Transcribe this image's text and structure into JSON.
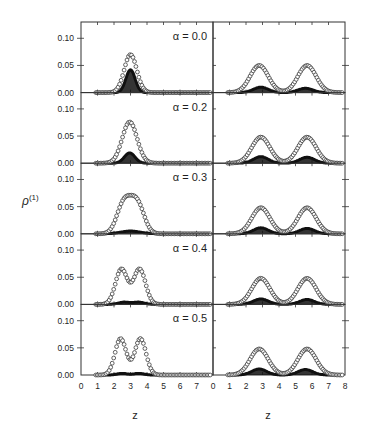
{
  "chart_data": {
    "type": "line",
    "title": "",
    "layout": {
      "rows": 5,
      "columns": 2,
      "shared_y_label": "ρ(1)",
      "xlabel": "z",
      "grid": false,
      "legend": "none; open circles and filled symbols as two series per panel"
    },
    "ylabel": "ρ(1)",
    "ylabel_main": "ρ",
    "ylabel_sup": "(1)",
    "xlabel": "z",
    "left_column": {
      "xlim": [
        0,
        8
      ],
      "x_tick_labels": [
        "0",
        "1",
        "2",
        "3",
        "4",
        "5",
        "6",
        "7"
      ],
      "ylim": [
        0,
        0.13
      ],
      "y_tick_labels": [
        "0.00",
        "0.05",
        "0.10"
      ],
      "y_ticks": [
        0,
        0.05,
        0.1
      ]
    },
    "right_column": {
      "xlim": [
        0,
        8
      ],
      "x_tick_labels": [
        "0",
        "1",
        "2",
        "3",
        "4",
        "5",
        "6",
        "7",
        "8"
      ],
      "ylim": [
        0,
        0.13
      ]
    },
    "series_names": [
      "open circles (total density)",
      "filled symbols"
    ],
    "panels": [
      {
        "label": "α = 0.0",
        "left": {
          "open": [
            {
              "mu": 3.0,
              "sigma": 0.38,
              "amp": 0.07
            }
          ],
          "filled": [
            {
              "mu": 3.0,
              "sigma": 0.28,
              "amp": 0.042
            }
          ]
        },
        "right": {
          "open": [
            {
              "mu": 2.8,
              "sigma": 0.55,
              "amp": 0.05
            },
            {
              "mu": 5.7,
              "sigma": 0.55,
              "amp": 0.05
            }
          ],
          "filled": [
            {
              "mu": 2.9,
              "sigma": 0.45,
              "amp": 0.01
            },
            {
              "mu": 5.6,
              "sigma": 0.45,
              "amp": 0.008
            }
          ]
        }
      },
      {
        "label": "α = 0.2",
        "left": {
          "open": [
            {
              "mu": 2.95,
              "sigma": 0.45,
              "amp": 0.076
            }
          ],
          "filled": [
            {
              "mu": 2.95,
              "sigma": 0.32,
              "amp": 0.019
            }
          ]
        },
        "right": {
          "open": [
            {
              "mu": 2.9,
              "sigma": 0.55,
              "amp": 0.048
            },
            {
              "mu": 5.7,
              "sigma": 0.55,
              "amp": 0.048
            }
          ],
          "filled": [
            {
              "mu": 2.9,
              "sigma": 0.45,
              "amp": 0.012
            },
            {
              "mu": 5.7,
              "sigma": 0.45,
              "amp": 0.011
            }
          ]
        }
      },
      {
        "label": "α = 0.3",
        "left": {
          "open": [
            {
              "mu": 2.6,
              "sigma": 0.42,
              "amp": 0.056
            },
            {
              "mu": 3.4,
              "sigma": 0.42,
              "amp": 0.056
            }
          ],
          "filled": [
            {
              "mu": 3.0,
              "sigma": 0.6,
              "amp": 0.005
            }
          ]
        },
        "right": {
          "open": [
            {
              "mu": 2.9,
              "sigma": 0.55,
              "amp": 0.048
            },
            {
              "mu": 5.7,
              "sigma": 0.55,
              "amp": 0.048
            }
          ],
          "filled": [
            {
              "mu": 2.9,
              "sigma": 0.45,
              "amp": 0.011
            },
            {
              "mu": 5.7,
              "sigma": 0.45,
              "amp": 0.01
            }
          ]
        }
      },
      {
        "label": "α = 0.4",
        "left": {
          "open": [
            {
              "mu": 2.45,
              "sigma": 0.36,
              "amp": 0.065
            },
            {
              "mu": 3.55,
              "sigma": 0.36,
              "amp": 0.065
            }
          ],
          "filled": [
            {
              "mu": 2.6,
              "sigma": 0.35,
              "amp": 0.004
            },
            {
              "mu": 3.5,
              "sigma": 0.35,
              "amp": 0.004
            }
          ]
        },
        "right": {
          "open": [
            {
              "mu": 2.9,
              "sigma": 0.55,
              "amp": 0.048
            },
            {
              "mu": 5.7,
              "sigma": 0.55,
              "amp": 0.048
            }
          ],
          "filled": [
            {
              "mu": 2.9,
              "sigma": 0.45,
              "amp": 0.01
            },
            {
              "mu": 5.7,
              "sigma": 0.45,
              "amp": 0.009
            }
          ]
        }
      },
      {
        "label": "α = 0.5",
        "left": {
          "open": [
            {
              "mu": 2.4,
              "sigma": 0.34,
              "amp": 0.067
            },
            {
              "mu": 3.6,
              "sigma": 0.34,
              "amp": 0.067
            }
          ],
          "filled": [
            {
              "mu": 2.5,
              "sigma": 0.3,
              "amp": 0.003
            },
            {
              "mu": 3.5,
              "sigma": 0.3,
              "amp": 0.003
            }
          ]
        },
        "right": {
          "open": [
            {
              "mu": 2.8,
              "sigma": 0.55,
              "amp": 0.048
            },
            {
              "mu": 5.7,
              "sigma": 0.55,
              "amp": 0.048
            }
          ],
          "filled": [
            {
              "mu": 2.8,
              "sigma": 0.45,
              "amp": 0.011
            },
            {
              "mu": 5.6,
              "sigma": 0.45,
              "amp": 0.01
            }
          ]
        }
      }
    ],
    "observed_peaks": {
      "left": {
        "α = 0.0": {
          "open_peak": 0.07,
          "filled_peak": 0.042,
          "z": 3.0
        },
        "α = 0.2": {
          "open_peak": 0.077,
          "filled_peak": 0.02,
          "z": 2.95
        },
        "α = 0.3": {
          "open_peak": 0.064,
          "filled_peak": 0.005,
          "z": [
            2.7,
            3.3
          ]
        },
        "α = 0.4": {
          "open_peak": 0.067,
          "dip": 0.038,
          "z": [
            2.45,
            3.55
          ]
        },
        "α = 0.5": {
          "open_peak": 0.068,
          "dip": 0.034,
          "z": [
            2.4,
            3.6
          ]
        }
      },
      "right": {
        "all": {
          "open_peak": 0.05,
          "dip": 0.02,
          "z": [
            2.9,
            5.7
          ],
          "filled_peak": 0.011
        }
      }
    },
    "colors": {
      "axes": "#333333",
      "open": "#3a3a3a",
      "filled": "#111111",
      "text": "#1f1f1f"
    }
  }
}
